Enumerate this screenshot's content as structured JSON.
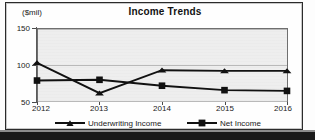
{
  "chart_data": {
    "type": "line",
    "title": "Income Trends",
    "ylabel": "($mil)",
    "xlabel": "",
    "categories": [
      "2012",
      "2013",
      "2014",
      "2015",
      "2016"
    ],
    "ylim": [
      50,
      150
    ],
    "yticks": [
      "50",
      "100",
      "150"
    ],
    "ytick_values": [
      50,
      100,
      150
    ],
    "grid": true,
    "legend_position": "bottom",
    "plot_background": "#eeeeee",
    "series": [
      {
        "name": "Underwriting Income",
        "marker": "triangle",
        "color": "#111111",
        "values": [
          103,
          62,
          93,
          92,
          92
        ]
      },
      {
        "name": "Net Income",
        "marker": "square",
        "color": "#111111",
        "values": [
          79,
          80,
          72,
          66,
          65
        ]
      }
    ]
  }
}
